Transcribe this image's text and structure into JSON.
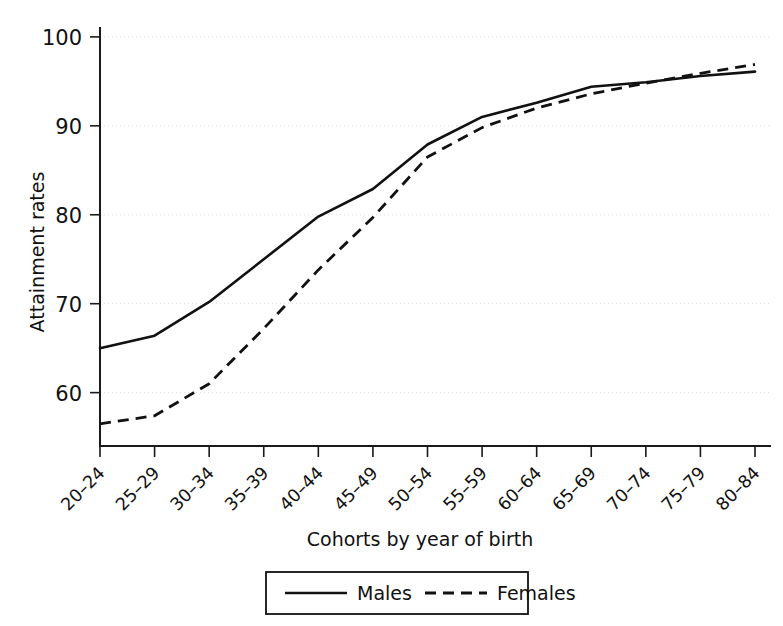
{
  "chart_data": {
    "type": "line",
    "title": "",
    "xlabel": "Cohorts by year of birth",
    "ylabel": "Attainment rates",
    "categories": [
      "20–24",
      "25–29",
      "30–34",
      "35–39",
      "40–44",
      "45–49",
      "50–54",
      "55–59",
      "60–64",
      "65–69",
      "70–74",
      "75–79",
      "80–84"
    ],
    "yticks": [
      60,
      70,
      80,
      90,
      100
    ],
    "ylim": [
      54,
      101
    ],
    "grid": true,
    "legend_position": "bottom-center",
    "series": [
      {
        "name": "Males",
        "style": "solid",
        "color": "#111111",
        "values": [
          65.0,
          66.4,
          70.2,
          75.0,
          79.8,
          82.9,
          87.9,
          91.0,
          92.6,
          94.4,
          94.9,
          95.6,
          96.1
        ]
      },
      {
        "name": "Females",
        "style": "dashed",
        "color": "#111111",
        "values": [
          56.5,
          57.4,
          61.0,
          67.2,
          73.8,
          79.7,
          86.5,
          89.8,
          92.0,
          93.6,
          94.8,
          95.9,
          96.9
        ]
      }
    ]
  },
  "axes": {
    "y_title": "Attainment rates",
    "x_title": "Cohorts by year of birth",
    "y_tick_labels": [
      "60",
      "70",
      "80",
      "90",
      "100"
    ],
    "x_tick_labels": [
      "20–24",
      "25–29",
      "30–34",
      "35–39",
      "40–44",
      "45–49",
      "50–54",
      "55–59",
      "60–64",
      "65–69",
      "70–74",
      "75–79",
      "80–84"
    ]
  },
  "legend": {
    "items": [
      {
        "label": "Males",
        "style": "solid"
      },
      {
        "label": "Females",
        "style": "dashed"
      }
    ]
  }
}
